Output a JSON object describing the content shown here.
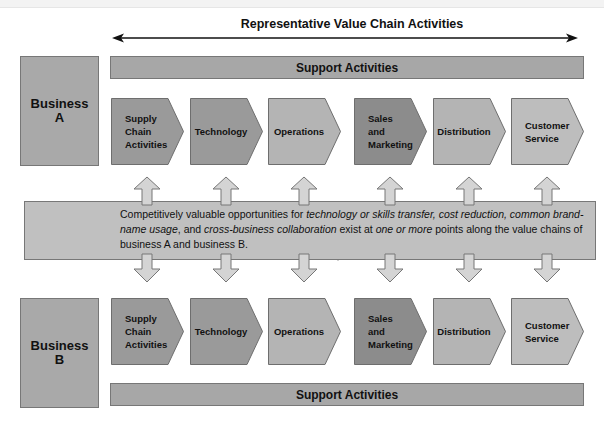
{
  "title": "Representative Value Chain Activities",
  "business_a": {
    "line1": "Business",
    "line2": "A"
  },
  "business_b": {
    "line1": "Business",
    "line2": "B"
  },
  "support_top": "Support Activities",
  "support_bottom": "Support Activities",
  "activities": [
    {
      "lines": [
        "Supply",
        "Chain",
        "Activities"
      ],
      "fill": "#9a9a9a"
    },
    {
      "lines": [
        "Technology"
      ],
      "fill": "#9a9a9a"
    },
    {
      "lines": [
        "Operations"
      ],
      "fill": "#b4b4b4"
    },
    {
      "lines": [
        "Sales",
        "and",
        "Marketing"
      ],
      "fill": "#8c8c8c"
    },
    {
      "lines": [
        "Distribution"
      ],
      "fill": "#b4b4b4"
    },
    {
      "lines": [
        "Customer",
        "Service"
      ],
      "fill": "#bdbdbd"
    }
  ],
  "opportunity_text": {
    "p1": "Competitively valuable opportunities for ",
    "i1": "technology or skills transfer, cost reduction, common brand-name usage",
    "p2": ", and ",
    "i2": "cross-business collaboration",
    "p3": " exist at ",
    "i3": "one or more",
    "p4": " points along the value chains of business A and business B."
  },
  "colors": {
    "box": "#a9a9a9",
    "band": "#c0c0c0",
    "arrow": "#d4d4d4",
    "border": "#777777"
  }
}
